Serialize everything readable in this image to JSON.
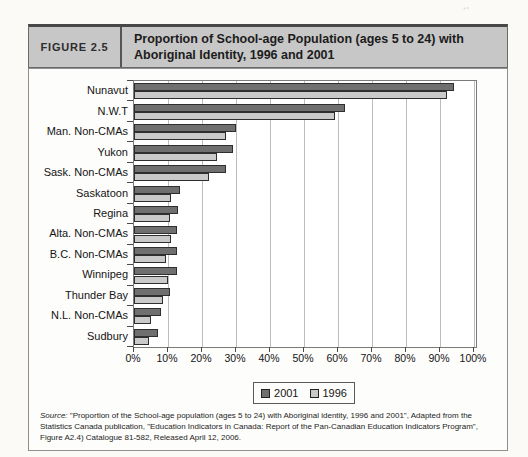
{
  "figure": {
    "label": "FIGURE 2.5",
    "title": "Proportion of School-age Population (ages 5 to 24) with Aboriginal Identity, 1996 and 2001"
  },
  "chart_data": {
    "type": "bar",
    "orientation": "horizontal",
    "title": "Proportion of School-age Population (ages 5 to 24) with Aboriginal Identity, 1996 and 2001",
    "categories": [
      "Nunavut",
      "N.W.T",
      "Man. Non-CMAs",
      "Yukon",
      "Sask. Non-CMAs",
      "Saskatoon",
      "Regina",
      "Alta. Non-CMAs",
      "B.C. Non-CMAs",
      "Winnipeg",
      "Thunder Bay",
      "N.L. Non-CMAs",
      "Sudbury"
    ],
    "series": [
      {
        "name": "2001",
        "color": "#6f6f6f",
        "values": [
          94,
          62,
          30,
          29,
          27,
          13.5,
          13,
          12.5,
          12.5,
          12.5,
          10.5,
          8,
          7
        ]
      },
      {
        "name": "1996",
        "color": "#c9c9c9",
        "values": [
          92,
          59,
          27,
          24.5,
          22,
          11,
          10.5,
          11,
          9.5,
          10,
          8.5,
          5,
          4.5
        ]
      }
    ],
    "xlabel": "",
    "ylabel": "",
    "xlim": [
      0,
      100
    ],
    "x_ticks": [
      "0%",
      "10%",
      "20%",
      "30%",
      "40%",
      "50%",
      "60%",
      "70%",
      "80%",
      "90%",
      "100%"
    ],
    "grid": true,
    "legend_position": "bottom"
  },
  "legend": {
    "items": [
      {
        "label": "2001",
        "color": "#6f6f6f"
      },
      {
        "label": "1996",
        "color": "#c9c9c9"
      }
    ]
  },
  "source": {
    "prefix": "Source:",
    "text": " \"Proportion of the School-age population (ages 5 to 24) with Aboriginal identity, 1996 and 2001\", Adapted from the Statistics Canada publication, \"Education Indicators in Canada: Report of the Pan-Canadian Education Indicators Program\", Figure A2.4) Catalogue 81-582, Released April 12, 2006."
  },
  "colors": {
    "header_bg": "#c7c7c7",
    "bar_2001": "#6f6f6f",
    "bar_1996": "#c9c9c9",
    "gridline": "#bdbdbd"
  }
}
